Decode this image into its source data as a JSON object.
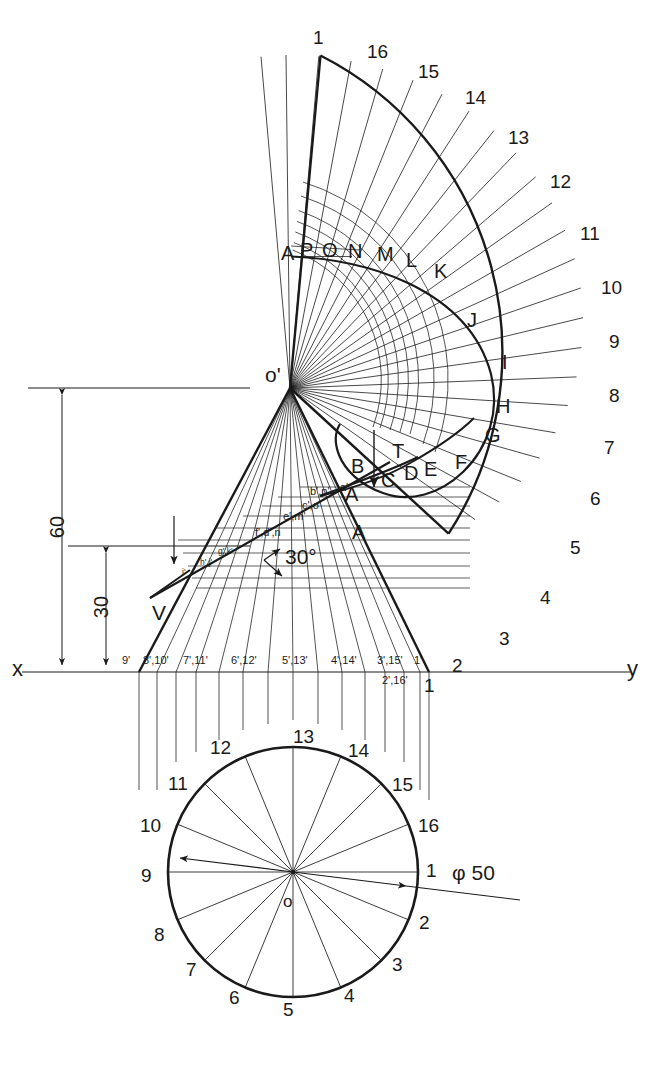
{
  "drawing": {
    "title": "Development of a cone cut by a 30° section plane",
    "line_color": "#1a1a1a",
    "bg_color": "#ffffff"
  },
  "development": {
    "name": "development-of-lateral-surface",
    "outer_generator_numbers": [
      "1",
      "16",
      "15",
      "14",
      "13",
      "12",
      "11",
      "10",
      "9",
      "8",
      "7",
      "6",
      "5",
      "4",
      "3",
      "2",
      "1"
    ],
    "curve_letters": [
      "A",
      "P",
      "O",
      "N",
      "M",
      "L",
      "K",
      "J",
      "I",
      "H",
      "G",
      "F",
      "E",
      "D",
      "C",
      "B",
      "A"
    ],
    "apex_label": "o'"
  },
  "front_view": {
    "name": "front-view-of-cone",
    "apex_label": "o'",
    "axis_left_label": "x",
    "axis_right_label": "y",
    "section_plane_label": "V",
    "angle_label": "30°",
    "dimensions": [
      {
        "value": "60",
        "name": "dimension-60"
      },
      {
        "value": "30",
        "name": "dimension-30"
      }
    ],
    "section_points_upper": [
      "b',p'",
      "a'",
      "c',o'",
      "e',m'",
      "f',d',n"
    ],
    "section_points_lower": [
      "g',k'",
      "h',j'",
      "i'"
    ],
    "cut_letters": [
      "A",
      "B",
      "C",
      "D",
      "E",
      "F",
      "G",
      "T"
    ],
    "ground_line_labels": [
      "9'",
      "8',10'",
      "7',11'",
      "6',12'",
      "5',13'",
      "4',14'",
      "3',15'",
      "1'"
    ],
    "ground_line_labels_below": [
      "2',16'"
    ],
    "base_corner_label": "1"
  },
  "top_view": {
    "name": "top-view-circle",
    "center_label": "o",
    "diameter_label": "φ 50",
    "division_numbers": [
      "1",
      "2",
      "3",
      "4",
      "5",
      "6",
      "7",
      "8",
      "9",
      "10",
      "11",
      "12",
      "13",
      "14",
      "15",
      "16"
    ]
  },
  "page": {
    "caption": ""
  }
}
